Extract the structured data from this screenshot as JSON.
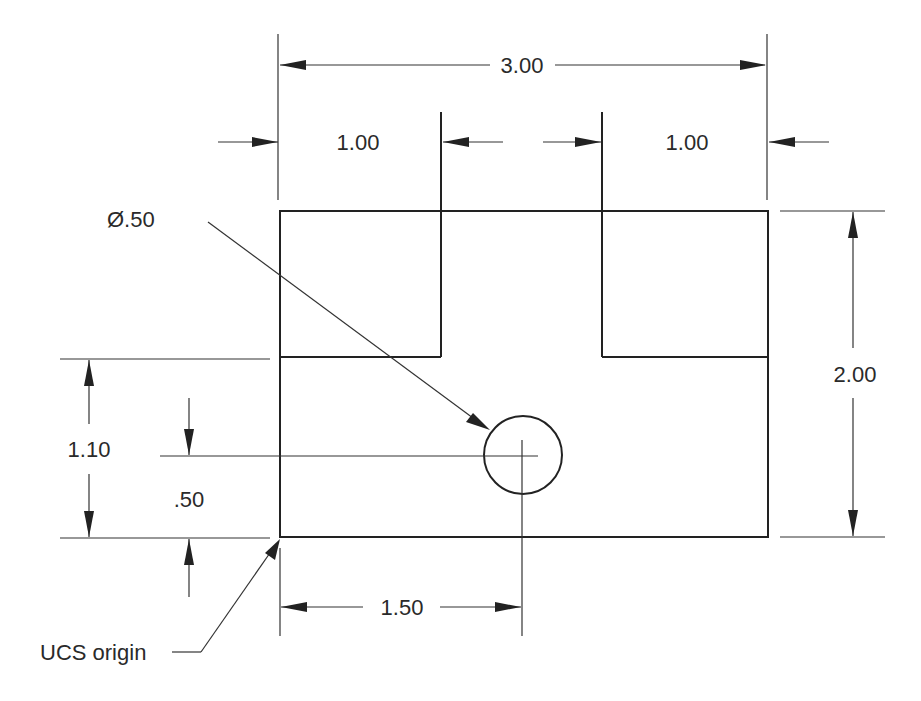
{
  "drawing": {
    "dimensions": {
      "overall_width": "3.00",
      "left_slot_offset": "1.00",
      "right_slot_offset": "1.00",
      "overall_height": "2.00",
      "slot_height": "1.10",
      "hole_y": ".50",
      "hole_x": "1.50",
      "hole_diameter": "Ø.50"
    },
    "labels": {
      "origin": "UCS origin"
    }
  }
}
